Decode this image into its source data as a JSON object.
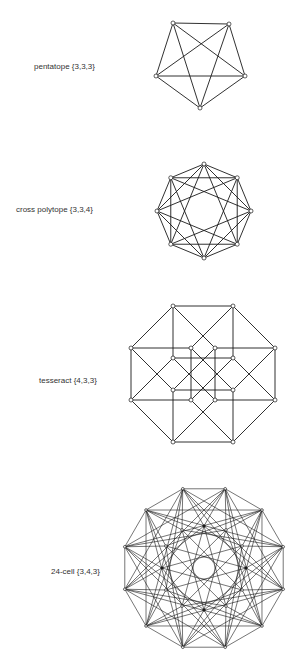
{
  "figures": [
    {
      "label": "pentatope {3,3,3}",
      "name": "pentatope",
      "schlafli": "{3,3,3}"
    },
    {
      "label": "cross polytope {3,3,4}",
      "name": "cross polytope",
      "schlafli": "{3,3,4}"
    },
    {
      "label": "tesseract {4,3,3}",
      "name": "tesseract",
      "schlafli": "{4,3,3}"
    },
    {
      "label": "24-cell {3,4,3}",
      "name": "24-cell",
      "schlafli": "{3,4,3}"
    }
  ],
  "colors": {
    "line": "#1a1a1a",
    "text": "#333333",
    "background": "#ffffff"
  }
}
